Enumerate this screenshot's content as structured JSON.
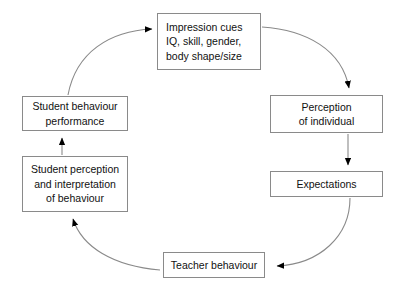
{
  "diagram": {
    "background_color": "#ffffff",
    "box_border_color": "#8a8a8a",
    "connector_color": "#8a8a8a",
    "arrowhead_color": "#000000",
    "nodes": [
      {
        "id": "impression-cues",
        "lines": [
          "Impression cues",
          "IQ, skill, gender,",
          "body shape/size"
        ]
      },
      {
        "id": "perception-of-individual",
        "lines": [
          "Perception",
          "of individual"
        ]
      },
      {
        "id": "expectations",
        "lines": [
          "Expectations"
        ]
      },
      {
        "id": "teacher-behaviour",
        "lines": [
          "Teacher behaviour"
        ]
      },
      {
        "id": "student-perception",
        "lines": [
          "Student perception",
          "and interpretation",
          "of behaviour"
        ]
      },
      {
        "id": "student-behaviour",
        "lines": [
          "Student behaviour",
          "performance"
        ]
      }
    ],
    "connectors": [
      {
        "id": "impression-to-perception",
        "from": "impression-cues",
        "to": "perception-of-individual",
        "style": "curved",
        "arrow": "down"
      },
      {
        "id": "perception-to-expectations",
        "from": "perception-of-individual",
        "to": "expectations",
        "style": "straight",
        "arrow": "down"
      },
      {
        "id": "expectations-to-teacher",
        "from": "expectations",
        "to": "teacher-behaviour",
        "style": "curved",
        "arrow": "left"
      },
      {
        "id": "teacher-to-student-perception",
        "from": "teacher-behaviour",
        "to": "student-perception",
        "style": "curved",
        "arrow": "up-left"
      },
      {
        "id": "student-perception-to-student-behaviour",
        "from": "student-perception",
        "to": "student-behaviour",
        "style": "straight",
        "arrow": "up"
      },
      {
        "id": "student-behaviour-to-impression",
        "from": "student-behaviour",
        "to": "impression-cues",
        "style": "curved",
        "arrow": "right"
      }
    ]
  }
}
